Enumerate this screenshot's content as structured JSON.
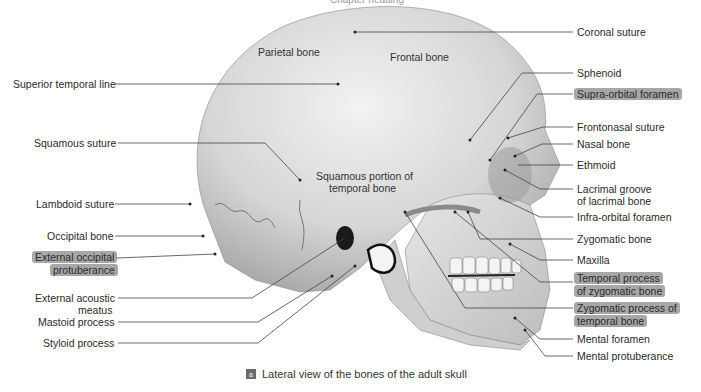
{
  "figure": {
    "top_cut_text": "Chapter heading",
    "caption_tag": "a",
    "caption": "Lateral view of the bones of the adult skull"
  },
  "inside_labels": {
    "parietal": "Parietal bone",
    "frontal": "Frontal bone",
    "squamous_portion_1": "Squamous portion of",
    "squamous_portion_2": "temporal bone"
  },
  "left_labels": {
    "superior_temporal_line": "Superior temporal line",
    "squamous_suture": "Squamous suture",
    "lambdoid_suture": "Lambdoid suture",
    "occipital_bone": "Occipital bone",
    "ext_occipital_1": "External occipital",
    "ext_occipital_2": "protuberance",
    "ext_acoustic_1": "External acoustic",
    "ext_acoustic_2": "meatus",
    "mastoid_process": "Mastoid process",
    "styloid_process": "Styloid process"
  },
  "right_labels": {
    "coronal_suture": "Coronal suture",
    "sphenoid": "Sphenoid",
    "supraorbital_foramen": "Supra-orbital foramen",
    "frontonasal_suture": "Frontonasal suture",
    "nasal_bone": "Nasal bone",
    "ethmoid": "Ethmoid",
    "lacrimal_1": "Lacrimal groove",
    "lacrimal_2": "of lacrimal bone",
    "infraorbital_foramen": "Infra-orbital foramen",
    "zygomatic_bone": "Zygomatic bone",
    "maxilla": "Maxilla",
    "temporal_process_1": "Temporal process",
    "temporal_process_2": "of zygomatic bone",
    "zygomatic_process_1": "Zygomatic process of",
    "zygomatic_process_2": "temporal bone",
    "mental_foramen": "Mental foramen",
    "mental_protuberance": "Mental protuberance"
  },
  "colors": {
    "bone": "#d9d9d9",
    "bone_shadow": "#9c9c9c",
    "leader_line": "#444444",
    "highlight": "#5f5f5f"
  }
}
